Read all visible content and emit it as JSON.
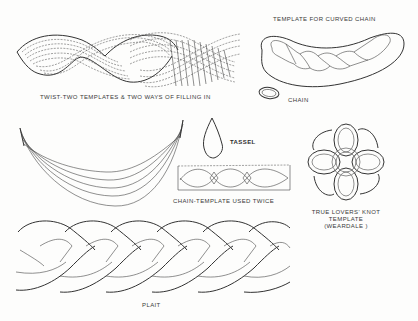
{
  "page": {
    "ink_color": "#3a3a3a",
    "paper_color": "#fdfdfc"
  },
  "figures": {
    "twist": {
      "caption": "TWIST-TWO TEMPLATES & TWO WAYS  OF  FILLING IN"
    },
    "curved_chain": {
      "caption": "TEMPLATE FOR CURVED CHAIN"
    },
    "chain": {
      "caption": "CHAIN"
    },
    "crescent": {
      "caption": ""
    },
    "tassel": {
      "caption": "TASSEL"
    },
    "chain_template": {
      "caption": "CHAIN-TEMPLATE USED TWICE"
    },
    "lovers_knot": {
      "caption_line1": "TRUE LOVERS' KNOT",
      "caption_line2": "TEMPLATE",
      "caption_line3": "(WEARDALE )"
    },
    "plait": {
      "caption": "PLAIT"
    }
  }
}
